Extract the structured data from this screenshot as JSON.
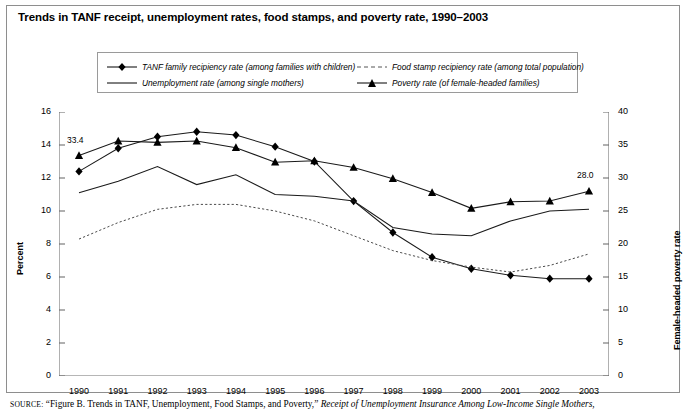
{
  "title": "Trends in TANF receipt, unemployment rates, food stamps, and poverty rate, 1990–2003",
  "source": {
    "label": "SOURCE:",
    "text_before": " “Figure B. Trends in TANF, Unemployment, Food Stamps, and Poverty,” ",
    "italic_part": "Receipt of Unemployment Insurance Among Low-Income Single Mothers,"
  },
  "legend": {
    "items": [
      {
        "key": "line-with-diamond-marker",
        "label": "TANF family recipiency rate (among families with children)"
      },
      {
        "key": "dashed-line",
        "label": "Food stamp recipiency rate (among total population)"
      },
      {
        "key": "solid-line",
        "label": "Unemployment rate (among single mothers)"
      },
      {
        "key": "line-with-triangle-marker",
        "label": "Poverty rate (of female-headed families)"
      }
    ]
  },
  "annotations": [
    {
      "name": "poverty-1990-value",
      "text": "33.4",
      "x": 1990,
      "y": 33.4
    },
    {
      "name": "poverty-2003-value",
      "text": "28.0",
      "x": 2003,
      "y": 28.0
    }
  ],
  "chart_data": {
    "type": "line",
    "title": "Trends in TANF receipt, unemployment rates, food stamps, and poverty rate, 1990–2003",
    "xlabel": "",
    "ylabel": "Percent",
    "y2label": "Female-headed poverty rate",
    "categories": [
      "1990",
      "1991",
      "1992",
      "1993",
      "1994",
      "1995",
      "1996",
      "1997",
      "1998",
      "1999",
      "2000",
      "2001",
      "2002",
      "2003"
    ],
    "x": [
      1990,
      1991,
      1992,
      1993,
      1994,
      1995,
      1996,
      1997,
      1998,
      1999,
      2000,
      2001,
      2002,
      2003
    ],
    "ylim": [
      0,
      16
    ],
    "yticks": [
      0,
      2,
      4,
      6,
      8,
      10,
      12,
      14,
      16
    ],
    "y2lim": [
      0,
      40
    ],
    "y2ticks": [
      0,
      5,
      10,
      15,
      20,
      25,
      30,
      35,
      40
    ],
    "grid": false,
    "legend_position": "top",
    "series": [
      {
        "name": "TANF family recipiency rate (among families with children)",
        "axis": "left",
        "marker": "diamond",
        "style": "solid",
        "values": [
          12.4,
          13.8,
          14.5,
          14.8,
          14.6,
          13.9,
          13.0,
          10.6,
          8.7,
          7.2,
          6.5,
          6.1,
          5.9,
          5.9
        ]
      },
      {
        "name": "Food stamp recipiency rate (among total population)",
        "axis": "left",
        "marker": "none",
        "style": "dashed",
        "values": [
          8.3,
          9.3,
          10.1,
          10.4,
          10.4,
          10.0,
          9.4,
          8.5,
          7.6,
          7.0,
          6.6,
          6.3,
          6.7,
          7.4
        ]
      },
      {
        "name": "Unemployment rate (among single mothers)",
        "axis": "left",
        "marker": "none",
        "style": "solid",
        "values": [
          11.1,
          11.8,
          12.7,
          11.6,
          12.2,
          11.0,
          10.9,
          10.6,
          9.0,
          8.6,
          8.5,
          9.4,
          10.0,
          10.1
        ]
      },
      {
        "name": "Poverty rate (of female-headed families)",
        "axis": "right",
        "marker": "triangle",
        "style": "solid",
        "values": [
          33.4,
          35.6,
          35.4,
          35.6,
          34.6,
          32.4,
          32.6,
          31.6,
          29.9,
          27.8,
          25.4,
          26.4,
          26.5,
          28.0
        ]
      }
    ]
  }
}
